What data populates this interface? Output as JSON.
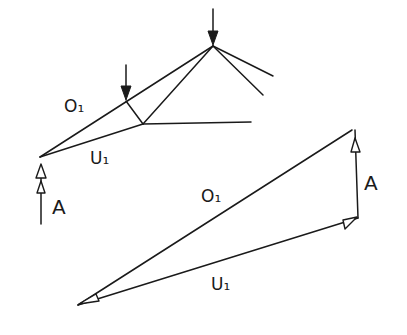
{
  "diagram": {
    "type": "truss force diagram (hand-drawn)",
    "truss": {
      "labels": {
        "upper_chord": "O₁",
        "lower_chord": "U₁",
        "support_reaction": "A"
      }
    },
    "force_polygon": {
      "labels": {
        "upper_chord": "O₁",
        "lower_chord": "U₁",
        "support_reaction": "A"
      }
    },
    "colors": {
      "ink": "#1a1a1a",
      "background": "#ffffff"
    }
  }
}
